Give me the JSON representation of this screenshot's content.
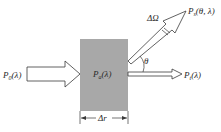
{
  "diagram": {
    "colors": {
      "slab_fill": "#a8a8a8",
      "stroke": "#3a3a3a",
      "text": "#2a2a2a",
      "background": "#ffffff"
    },
    "labels": {
      "incident": "P",
      "incident_sub": "0",
      "incident_arg": "(λ)",
      "absorbed": "P",
      "absorbed_sub": "a",
      "absorbed_arg": "(λ)",
      "transmitted": "P",
      "transmitted_sub": "t",
      "transmitted_arg": "(λ)",
      "scattered": "P",
      "scattered_sub": "s",
      "scattered_arg": "(θ, λ)",
      "solid_angle": "ΔΩ",
      "angle": "θ",
      "thickness": "Δr"
    }
  }
}
